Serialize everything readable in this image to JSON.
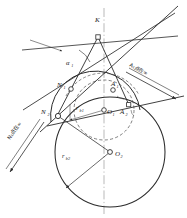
{
  "figure": {
    "background_color": "#ffffff",
    "line_color": "#2b2b2b",
    "dash_color": "#4a4a4a",
    "axis_color": "#7a7a7a",
    "node_fill": "#ffffff"
  },
  "labels": {
    "K": "K",
    "N1": "N",
    "N1_sub": "1",
    "N2": "N",
    "N2_sub": "2",
    "A1": "A",
    "A1_sub": "1",
    "A2": "A",
    "A2_sub": "2",
    "O1": "O",
    "O1_sub": "1",
    "O2": "O",
    "O2_sub": "2",
    "alpha1": "α",
    "alpha1_sub": "1",
    "rb1": "r",
    "rb1_sub": "b1",
    "rb2": "r",
    "rb2_sub": "b2",
    "note_right": "A₁点在∞",
    "note_left": "N₁点在∞"
  },
  "geometry": {
    "K": {
      "x": 98,
      "y": 37
    },
    "O1": {
      "x": 104,
      "y": 110
    },
    "O2": {
      "x": 110,
      "y": 152
    },
    "N1": {
      "x": 71,
      "y": 89
    },
    "N2": {
      "x": 58,
      "y": 116
    },
    "A1": {
      "x": 113,
      "y": 90
    },
    "A2": {
      "x": 128,
      "y": 104
    },
    "r_base1": 30,
    "r_base2": 55,
    "r_solid_upper": 41,
    "axis_x": 104,
    "alpha_deg": 20
  },
  "annotations": {
    "right_arrow_label_angle_deg": 36,
    "left_arrow_label_angle_deg": 52
  }
}
